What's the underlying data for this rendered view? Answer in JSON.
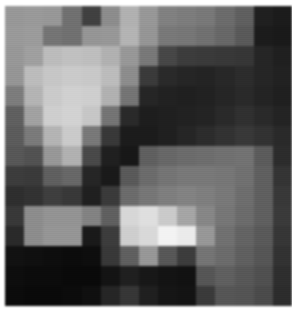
{
  "image": {
    "kind": "pixelated-grayscale-heatmap",
    "title": "Pixelated Grayscale Grid",
    "colorspace": "grayscale",
    "rendering": "nearest-neighbour upscale with resampling blur",
    "background_color": "#ffffff",
    "content_rect": {
      "x": 5,
      "y": 6,
      "width": 287,
      "height": 300
    },
    "grid": {
      "columns": 15,
      "rows": 15,
      "cell_width": 19.13,
      "cell_height": 20.0
    },
    "value_range": {
      "min": 0,
      "max": 255
    }
  },
  "chart_data": {
    "type": "heatmap",
    "xlabel": "",
    "ylabel": "",
    "columns": 15,
    "rows": 15,
    "colormap": "gray",
    "vmin": 0,
    "vmax": 255,
    "grid": false,
    "legend": "none",
    "values": [
      [
        150,
        152,
        150,
        112,
        66,
        140,
        176,
        150,
        128,
        124,
        120,
        108,
        96,
        34,
        30
      ],
      [
        152,
        154,
        116,
        112,
        148,
        150,
        178,
        148,
        120,
        118,
        112,
        104,
        90,
        30,
        28
      ],
      [
        150,
        158,
        186,
        190,
        188,
        176,
        150,
        120,
        72,
        62,
        60,
        58,
        56,
        40,
        34
      ],
      [
        148,
        186,
        196,
        200,
        198,
        186,
        140,
        60,
        44,
        40,
        38,
        42,
        46,
        40,
        36
      ],
      [
        124,
        178,
        200,
        206,
        204,
        176,
        116,
        40,
        36,
        34,
        36,
        40,
        44,
        38,
        34
      ],
      [
        96,
        160,
        204,
        208,
        196,
        116,
        44,
        32,
        34,
        36,
        38,
        44,
        50,
        44,
        38
      ],
      [
        92,
        122,
        178,
        200,
        120,
        58,
        30,
        30,
        34,
        40,
        46,
        52,
        58,
        52,
        44
      ],
      [
        88,
        82,
        150,
        176,
        74,
        34,
        26,
        96,
        104,
        108,
        110,
        112,
        114,
        92,
        46
      ],
      [
        62,
        60,
        96,
        104,
        40,
        28,
        90,
        108,
        116,
        120,
        120,
        118,
        112,
        96,
        54
      ],
      [
        48,
        52,
        64,
        58,
        34,
        60,
        108,
        118,
        126,
        130,
        126,
        120,
        110,
        96,
        58
      ],
      [
        58,
        140,
        146,
        146,
        130,
        96,
        212,
        220,
        200,
        164,
        134,
        118,
        108,
        96,
        60
      ],
      [
        44,
        140,
        148,
        148,
        28,
        62,
        204,
        214,
        240,
        232,
        150,
        112,
        100,
        90,
        56
      ],
      [
        20,
        18,
        16,
        14,
        16,
        58,
        96,
        150,
        88,
        62,
        116,
        108,
        96,
        86,
        52
      ],
      [
        16,
        14,
        14,
        12,
        12,
        22,
        34,
        26,
        22,
        20,
        86,
        96,
        88,
        80,
        48
      ],
      [
        14,
        12,
        12,
        14,
        18,
        40,
        56,
        34,
        24,
        22,
        60,
        86,
        84,
        76,
        46
      ]
    ]
  }
}
